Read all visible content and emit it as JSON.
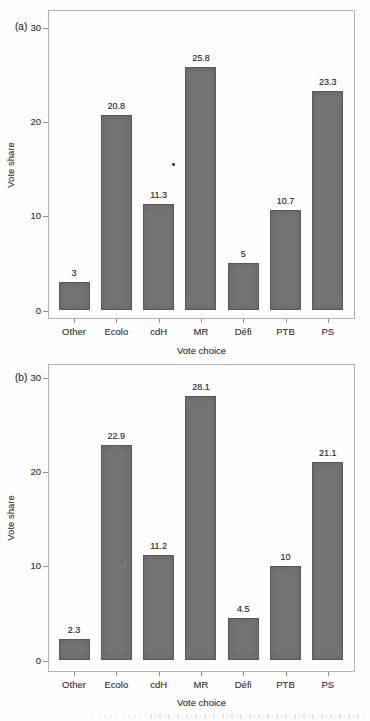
{
  "figure": {
    "background": "#fdfdfd",
    "bar_fill": "#747474",
    "bar_edge": "#585858",
    "axis_color": "#8f8f8f",
    "text_color": "#3a3a3a"
  },
  "chart_data": [
    {
      "type": "bar",
      "panel_label": "(a)",
      "title": "",
      "xlabel": "Vote choice",
      "ylabel": "Vote share",
      "categories": [
        "Other",
        "Ecolo",
        "cdH",
        "MR",
        "Défi",
        "PTB",
        "PS"
      ],
      "values": [
        3,
        20.8,
        11.3,
        25.8,
        5,
        10.7,
        23.3
      ],
      "value_labels": [
        "3",
        "20.8",
        "11.3",
        "25.8",
        "5",
        "10.7",
        "23.3"
      ],
      "yticks": [
        0,
        10,
        20,
        30
      ],
      "ytick_labels": [
        "0",
        "10",
        "20",
        "30"
      ],
      "ylim": [
        0,
        30
      ],
      "grid": false,
      "legend": "none"
    },
    {
      "type": "bar",
      "panel_label": "(b)",
      "title": "",
      "xlabel": "Vote choice",
      "ylabel": "Vote share",
      "categories": [
        "Other",
        "Ecolo",
        "cdH",
        "MR",
        "Défi",
        "PTB",
        "PS"
      ],
      "values": [
        2.3,
        22.9,
        11.2,
        28.1,
        4.5,
        10,
        21.1
      ],
      "value_labels": [
        "2.3",
        "22.9",
        "11.2",
        "28.1",
        "4.5",
        "10",
        "21.1"
      ],
      "yticks": [
        0,
        10,
        20,
        30
      ],
      "ytick_labels": [
        "0",
        "10",
        "20",
        "30"
      ],
      "ylim": [
        0,
        30
      ],
      "grid": false,
      "legend": "none"
    }
  ]
}
